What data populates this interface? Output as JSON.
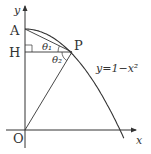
{
  "diagram": {
    "curve_equation": "y=1−x²",
    "axis_labels": {
      "x": "x",
      "y": "y"
    },
    "points": {
      "origin": "O",
      "A": "A",
      "H": "H",
      "P": "P"
    },
    "angles": {
      "theta1": "θ₁",
      "theta2": "θ₂"
    },
    "colors": {
      "stroke": "#333333",
      "background": "#ffffff"
    }
  }
}
